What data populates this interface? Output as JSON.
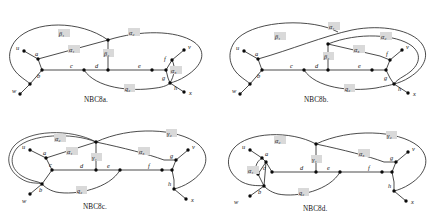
{
  "figure": {
    "kind": "four-graph-diagram-figure",
    "panel_count": 4
  },
  "panels": [
    {
      "id": "nbc8a",
      "caption": "NBC8a.",
      "vertex_labels": [
        "u",
        "w",
        "a",
        "b",
        "c",
        "d",
        "e",
        "f",
        "g",
        "h",
        "v",
        "x"
      ],
      "edge_labels": [
        {
          "name": "beta1",
          "text": "β₁"
        },
        {
          "name": "alpha1",
          "text": "α₁"
        },
        {
          "name": "alpha2",
          "text": "α₂"
        },
        {
          "name": "beta2",
          "text": "β₂"
        },
        {
          "name": "alpha3",
          "text": "α₃"
        },
        {
          "name": "q2",
          "text": "q₂"
        }
      ]
    },
    {
      "id": "nbc8b",
      "caption": "NBC8b.",
      "vertex_labels": [
        "u",
        "w",
        "a",
        "b",
        "c",
        "d",
        "e",
        "f",
        "g",
        "h",
        "v",
        "x"
      ],
      "edge_labels": [
        {
          "name": "beta1",
          "text": "β₁"
        },
        {
          "name": "alpha1",
          "text": "α₁"
        },
        {
          "name": "alpha2",
          "text": "α₂"
        },
        {
          "name": "alpha3",
          "text": "α₃"
        },
        {
          "name": "beta2",
          "text": "β₂"
        },
        {
          "name": "q2",
          "text": "q₂"
        }
      ]
    },
    {
      "id": "nbc8c",
      "caption": "NBC8c.",
      "vertex_labels": [
        "u",
        "w",
        "a",
        "b",
        "c",
        "d",
        "e",
        "f",
        "g",
        "h",
        "v",
        "x"
      ],
      "edge_labels": [
        {
          "name": "alpha2",
          "text": "α₂"
        },
        {
          "name": "alpha1",
          "text": "α₁"
        },
        {
          "name": "gamma1",
          "text": "γ₁"
        },
        {
          "name": "gamma2",
          "text": "γ₂"
        },
        {
          "name": "alpha3",
          "text": "α₃"
        },
        {
          "name": "q2",
          "text": "q₂"
        }
      ]
    },
    {
      "id": "nbc8d",
      "caption": "NBC8d.",
      "vertex_labels": [
        "u",
        "w",
        "a",
        "b",
        "c",
        "d",
        "e",
        "f",
        "g",
        "h",
        "v",
        "x"
      ],
      "edge_labels": [
        {
          "name": "alpha2",
          "text": "α₂"
        },
        {
          "name": "alpha1",
          "text": "α₁"
        },
        {
          "name": "gamma1",
          "text": "γ₁"
        },
        {
          "name": "gamma2",
          "text": "γ₂"
        },
        {
          "name": "alpha3",
          "text": "α₃"
        },
        {
          "name": "q2",
          "text": "q₂"
        }
      ]
    }
  ],
  "colors": {
    "stroke": "#2b2b2b",
    "node": "#0a0a0a",
    "text": "#111111",
    "label_highlight": "#d9d9d9",
    "background": "#ffffff"
  }
}
